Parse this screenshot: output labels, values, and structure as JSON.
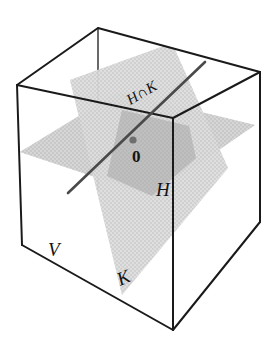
{
  "figure": {
    "canvas": {
      "width": 276,
      "height": 345,
      "background": "#ffffff"
    },
    "labels": {
      "intersection": "H∩K",
      "origin": "0",
      "plane_h": "H",
      "space_v": "V",
      "plane_k": "K"
    },
    "colors": {
      "outline": "#1a1a1a",
      "plane_h_fill": "#b9b9b9",
      "plane_k_fill": "#c6c6c6",
      "overlap_fill": "#a6a6a6",
      "intersection_line": "#4a4a4a",
      "origin_dot": "#6e6e6e",
      "label": "#141414"
    },
    "cube": {
      "name": "V",
      "vertices": {
        "top_back_left": [
          17,
          85
        ],
        "top_back_right": [
          260,
          72
        ],
        "top_front_left": [
          17,
          85
        ],
        "front_top": [
          173,
          118
        ],
        "bottom_front": [
          173,
          330
        ],
        "bottom_left": [
          22,
          245
        ],
        "bottom_right": [
          260,
          222
        ],
        "top_left_far": [
          98,
          28
        ],
        "top_right_far": [
          173,
          118
        ]
      }
    },
    "planes": [
      {
        "name": "H",
        "orientation": "horizontal",
        "description": "Horizontal plane through the origin, drawn as a parallelogram"
      },
      {
        "name": "K",
        "orientation": "oblique-vertical",
        "description": "Tilted vertical plane through the origin, drawn as a parallelogram"
      }
    ],
    "intersection": {
      "name": "H∩K",
      "description": "Line where planes H and K meet, passing through the origin",
      "from": [
        68,
        193
      ],
      "to": [
        205,
        62
      ]
    },
    "origin_point": {
      "x": 133,
      "y": 140,
      "radius": 3.4
    }
  }
}
